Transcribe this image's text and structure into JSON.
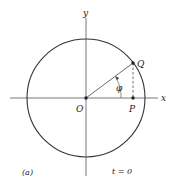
{
  "diagram": {
    "labels": {
      "y_axis": "y",
      "x_axis": "x",
      "origin": "O",
      "point_q": "Q",
      "point_p": "P",
      "angle": "φ",
      "panel": "(a)",
      "time": "t = 0"
    },
    "geometry": {
      "center": [
        86,
        98
      ],
      "radius": 59,
      "q_point": [
        133,
        63
      ],
      "p_point": [
        133,
        98
      ]
    },
    "colors": {
      "stroke": "#333333"
    }
  }
}
